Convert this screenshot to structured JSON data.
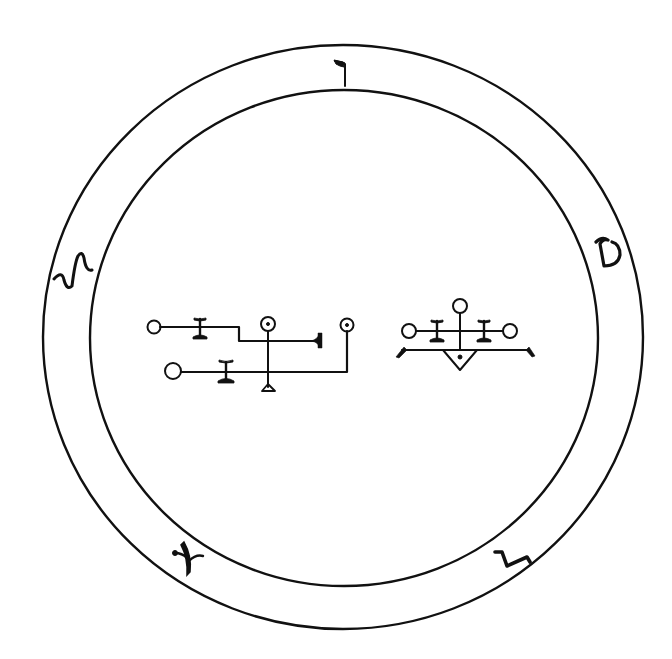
{
  "figure": {
    "type": "magical seal / sigil illustration",
    "background_color": "#ffffff",
    "ink_color": "#111111"
  },
  "border_letters": [
    {
      "position": "top",
      "glyph": "ד",
      "name": "dalet"
    },
    {
      "position": "right",
      "glyph": "ט",
      "name": "tet"
    },
    {
      "position": "bottom-right",
      "glyph": "ב",
      "name": "bet"
    },
    {
      "position": "bottom-left",
      "glyph": "א",
      "name": "alef"
    },
    {
      "position": "left",
      "glyph": "ש",
      "name": "shin"
    }
  ],
  "sigils": {
    "left": {
      "description": "linked circles, bars and lines sigil"
    },
    "right": {
      "description": "three circles with cross-bars over a line and triangle"
    }
  }
}
